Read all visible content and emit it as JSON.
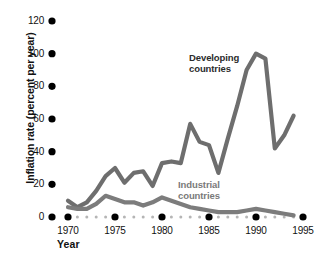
{
  "chart_data": {
    "type": "line",
    "title": "",
    "xlabel": "Year",
    "ylabel": "Inflation rate (percent per year)",
    "xlim": [
      1969,
      1996
    ],
    "ylim": [
      0,
      126
    ],
    "grid": false,
    "legend_position": "inline-annotation",
    "x_ticks": [
      1970,
      1975,
      1980,
      1985,
      1990,
      1995
    ],
    "x_tick_labels": [
      "1970",
      "1975",
      "1980",
      "1985",
      "1990",
      "1995"
    ],
    "y_ticks": [
      0,
      20,
      40,
      60,
      80,
      100,
      120
    ],
    "y_tick_labels": [
      "0",
      "20",
      "40",
      "60",
      "80",
      "100",
      "120"
    ],
    "x": [
      1970,
      1971,
      1972,
      1973,
      1974,
      1975,
      1976,
      1977,
      1978,
      1979,
      1980,
      1981,
      1982,
      1983,
      1984,
      1985,
      1986,
      1987,
      1988,
      1989,
      1990,
      1991,
      1992,
      1993,
      1994
    ],
    "series": [
      {
        "name": "Developing countries",
        "color": "#6e6e6e",
        "values": [
          10,
          6,
          9,
          16,
          25,
          30,
          21,
          27,
          28,
          19,
          33,
          34,
          33,
          57,
          46,
          44,
          27,
          48,
          68,
          90,
          100,
          97,
          42,
          50,
          62
        ]
      },
      {
        "name": "Industrial countries",
        "color": "#7c7c7c",
        "values": [
          6,
          5,
          5,
          8,
          13,
          11,
          9,
          9,
          7,
          9,
          12,
          10,
          8,
          6,
          5,
          4,
          3,
          3,
          3,
          4,
          5,
          4,
          3,
          2,
          1
        ]
      }
    ],
    "annotations": [
      {
        "text_line1": "Developing",
        "text_line2": "countries",
        "near_year": 1988
      },
      {
        "text_line1": "Industrial",
        "text_line2": "countries",
        "near_year": 1986
      }
    ],
    "axis_marker_style": {
      "major_dot_color": "#000000",
      "minor_dot_color": "#b5b5b5",
      "major_dot_radius": 3.6,
      "minor_dot_radius": 1.5
    }
  },
  "axes": {
    "y_title": "Inflation rate (percent per year)",
    "x_title": "Year"
  },
  "labels": {
    "developing_line1": "Developing",
    "developing_line2": "countries",
    "industrial_line1": "Industrial",
    "industrial_line2": "countries"
  }
}
